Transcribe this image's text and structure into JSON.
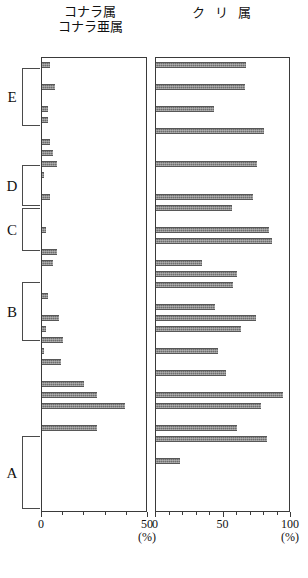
{
  "figure": {
    "panels": [
      {
        "key": "left",
        "title": "コナラ属\nコナラ亜属",
        "xmax": 50,
        "xlabel": "(%)"
      },
      {
        "key": "right",
        "title": "ク リ 属",
        "xmax": 100,
        "xlabel": "(%)"
      }
    ]
  },
  "axes": {
    "left": {
      "ticklabels": [
        "0",
        "50"
      ],
      "tickvalues": [
        0,
        50
      ],
      "minor_step": 10,
      "unit": "(%)"
    },
    "right": {
      "ticklabels": [
        "0",
        "50",
        "100"
      ],
      "tickvalues": [
        0,
        50,
        100
      ],
      "minor_step": 10,
      "unit": "(%)"
    }
  },
  "zones": [
    {
      "label": "E",
      "top": 68,
      "bottom": 126
    },
    {
      "label": "D",
      "top": 165,
      "bottom": 206
    },
    {
      "label": "C",
      "top": 208,
      "bottom": 251
    },
    {
      "label": "B",
      "top": 282,
      "bottom": 341
    },
    {
      "label": "A",
      "top": 436,
      "bottom": 509
    }
  ],
  "chart_data": {
    "type": "bar",
    "orientation": "horizontal",
    "layout": "two panels sharing a vertical depth axis, bars grow rightward from each panel's left baseline",
    "xlabel": "(%)",
    "ylabel": "",
    "grid": false,
    "legend": "none",
    "ylim_px": [
      57,
      512
    ],
    "row_pitch_px": 11,
    "bar_height_px": 6,
    "series": [
      {
        "name": "コナラ属コナラ亜属",
        "panel": "left",
        "xlim": [
          0,
          50
        ],
        "values": [
          4,
          0,
          6,
          0,
          3,
          3,
          0,
          4,
          5,
          7,
          1,
          0,
          4,
          0,
          0,
          2,
          0,
          7,
          5,
          0,
          0,
          3,
          0,
          8,
          2,
          10,
          1,
          9,
          0,
          20,
          26,
          39,
          0,
          26,
          0,
          0,
          0,
          0,
          0,
          0,
          0,
          0,
          0,
          0,
          0,
          0,
          0,
          0,
          37,
          50,
          78,
          65
        ]
      },
      {
        "name": "クリ属",
        "panel": "right",
        "xlim": [
          0,
          100
        ],
        "values": [
          67,
          0,
          66,
          0,
          43,
          0,
          80,
          0,
          0,
          75,
          0,
          0,
          72,
          56,
          0,
          84,
          86,
          0,
          34,
          60,
          57,
          0,
          44,
          74,
          63,
          0,
          46,
          0,
          52,
          0,
          94,
          78,
          0,
          60,
          82,
          0,
          18,
          0,
          0,
          0,
          0,
          25,
          0,
          0,
          0,
          0,
          0,
          0,
          1,
          0,
          2,
          0
        ]
      }
    ]
  }
}
